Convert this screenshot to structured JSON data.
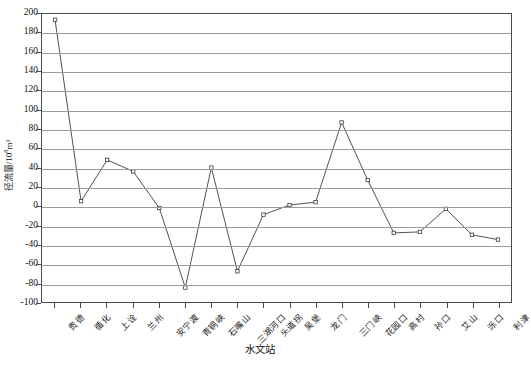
{
  "chart_data": {
    "type": "line",
    "title": "",
    "xlabel": "水文站",
    "ylabel": "径流量/10⁸m³",
    "ylabel_main": "径流量/10",
    "ylabel_exp": "8",
    "ylabel_tail": "m³",
    "ylim": [
      -100,
      200
    ],
    "ytick_step": 20,
    "yticks": [
      200,
      180,
      160,
      140,
      120,
      100,
      80,
      60,
      40,
      20,
      0,
      -20,
      -40,
      -60,
      -80,
      -100
    ],
    "ytick_labels": [
      "200",
      "180",
      "160",
      "140",
      "120",
      "100",
      "80",
      "60",
      "40",
      "20",
      "0",
      "-20",
      "-40",
      "-60",
      "-80",
      "-100"
    ],
    "grid": true,
    "grid_orientation": "horizontal",
    "legend": false,
    "legend_position": "none",
    "marker": "open-square",
    "line_color": "#3c3c3c",
    "grid_color": "#9c9c9c",
    "axis_color": "#4a4a4a",
    "categories": [
      "贵德",
      "循化",
      "上诠",
      "兰州",
      "安宁渡",
      "青铜峡",
      "石嘴山",
      "三湖河口",
      "头道拐",
      "吴堡",
      "龙门",
      "三门峡",
      "花园口",
      "高村",
      "孙口",
      "艾山",
      "泺口",
      "利津"
    ],
    "values": [
      194,
      5,
      48,
      36,
      -2,
      -85,
      40,
      -68,
      -9,
      1,
      4,
      87,
      27,
      -28,
      -27,
      -3,
      -30,
      -35
    ]
  },
  "xtitle": "水文站"
}
